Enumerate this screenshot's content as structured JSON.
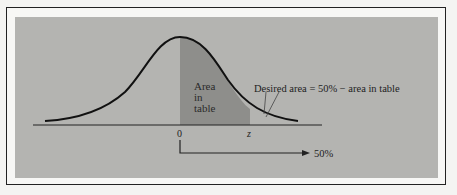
{
  "diagram": {
    "type": "normal-distribution",
    "shaded_region_label_lines": [
      "Area",
      "in",
      "table"
    ],
    "annotation": "Desired area = 50% − area in table",
    "axis_labels": {
      "mean": "0",
      "z": "z"
    },
    "arrow_label": "50%"
  },
  "colors": {
    "panel": "#b4b4b1",
    "shaded": "#8e8e8b",
    "curve": "#111111"
  }
}
